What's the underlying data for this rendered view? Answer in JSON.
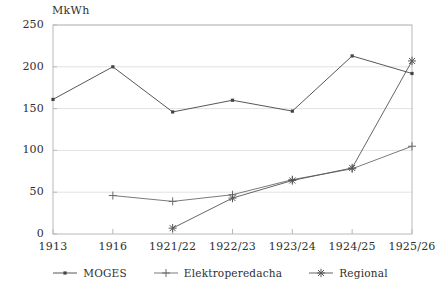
{
  "chart_data": {
    "type": "line",
    "title": "",
    "unit_label": "MkWh",
    "xlabel": "",
    "ylabel": "MkWh",
    "categories": [
      "1913",
      "1916",
      "1921/22",
      "1922/23",
      "1923/24",
      "1924/25",
      "1925/26"
    ],
    "ylim": [
      0,
      250
    ],
    "yticks": [
      0,
      50,
      100,
      150,
      200,
      250
    ],
    "grid": true,
    "legend_position": "bottom",
    "series": [
      {
        "name": "MOGES",
        "marker": "dot",
        "color": "#444444",
        "values": [
          161,
          200,
          146,
          160,
          147,
          213,
          192
        ]
      },
      {
        "name": "Elektroperedacha",
        "marker": "plus",
        "color": "#6b6b6b",
        "values": [
          null,
          46,
          39,
          47,
          65,
          78,
          105
        ]
      },
      {
        "name": "Regional",
        "marker": "asterisk",
        "color": "#555555",
        "values": [
          null,
          null,
          7,
          43,
          64,
          79,
          207
        ]
      }
    ]
  },
  "axis": {
    "ytick_labels": [
      "0",
      "50",
      "100",
      "150",
      "200",
      "250"
    ],
    "xtick_labels": [
      "1913",
      "1916",
      "1921/22",
      "1922/23",
      "1923/24",
      "1924/25",
      "1925/26"
    ]
  },
  "legend": {
    "items": [
      {
        "label": "MOGES",
        "marker": "dot"
      },
      {
        "label": "Elektroperedacha",
        "marker": "plus"
      },
      {
        "label": "Regional",
        "marker": "asterisk"
      }
    ]
  },
  "colors": {
    "frame": "#b9b9b9",
    "grid": "#e2e2e2",
    "line": "#4a4a4a",
    "text": "#2f2f2f",
    "background": "#ffffff"
  }
}
